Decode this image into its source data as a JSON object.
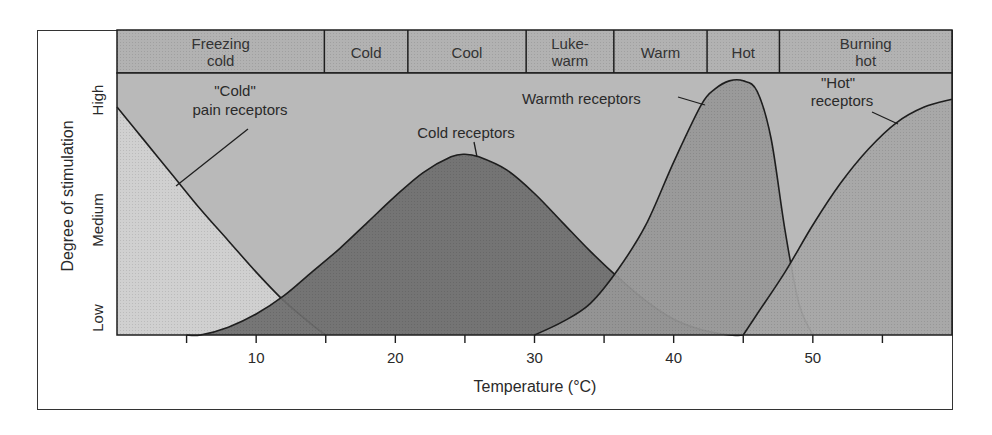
{
  "chart_data": {
    "type": "area",
    "title": "",
    "xlabel": "Temperature (°C)",
    "ylabel": "Degree of stimulation",
    "xlim": [
      0,
      60
    ],
    "xticks": [
      5,
      10,
      15,
      20,
      25,
      30,
      35,
      40,
      45,
      50,
      55
    ],
    "xtick_labels": {
      "10": "10",
      "20": "20",
      "30": "30",
      "40": "40",
      "50": "50"
    },
    "y_levels": [
      "Low",
      "Medium",
      "High"
    ],
    "ylim": [
      0,
      1
    ],
    "grid": false,
    "temperature_bands": [
      {
        "label_line1": "Freezing",
        "label_line2": "cold",
        "from": 0,
        "to": 14.9
      },
      {
        "label_line1": "Cold",
        "label_line2": "",
        "from": 14.9,
        "to": 20.9
      },
      {
        "label_line1": "Cool",
        "label_line2": "",
        "from": 20.9,
        "to": 29.4
      },
      {
        "label_line1": "Luke-",
        "label_line2": "warm",
        "from": 29.4,
        "to": 35.7
      },
      {
        "label_line1": "Warm",
        "label_line2": "",
        "from": 35.7,
        "to": 42.4
      },
      {
        "label_line1": "Hot",
        "label_line2": "",
        "from": 42.4,
        "to": 47.6
      },
      {
        "label_line1": "Burning",
        "label_line2": "hot",
        "from": 47.6,
        "to": 60
      }
    ],
    "series": [
      {
        "name": "\"Cold\" pain receptors",
        "x": [
          0,
          2,
          4,
          6,
          8,
          10,
          12,
          14,
          15
        ],
        "values": [
          0.87,
          0.74,
          0.61,
          0.48,
          0.36,
          0.24,
          0.13,
          0.04,
          0.0
        ]
      },
      {
        "name": "Cold receptors",
        "x": [
          5,
          6,
          8,
          10,
          12,
          14,
          16,
          18,
          20,
          22,
          24,
          25,
          26,
          28,
          30,
          32,
          34,
          36,
          38,
          40,
          42,
          44,
          45
        ],
        "values": [
          0.0,
          0.0,
          0.03,
          0.08,
          0.15,
          0.24,
          0.33,
          0.43,
          0.53,
          0.62,
          0.68,
          0.69,
          0.68,
          0.63,
          0.54,
          0.43,
          0.32,
          0.22,
          0.13,
          0.06,
          0.02,
          0.0,
          0.0
        ]
      },
      {
        "name": "Warmth receptors",
        "x": [
          30,
          32,
          34,
          36,
          38,
          40,
          42,
          43,
          44,
          45,
          46,
          47,
          48,
          49,
          50
        ],
        "values": [
          0.0,
          0.05,
          0.12,
          0.25,
          0.42,
          0.66,
          0.88,
          0.94,
          0.97,
          0.97,
          0.93,
          0.75,
          0.4,
          0.12,
          0.0
        ]
      },
      {
        "name": "\"Hot\" receptors",
        "x": [
          45,
          46,
          48,
          50,
          52,
          54,
          56,
          58,
          60
        ],
        "values": [
          0.0,
          0.08,
          0.24,
          0.42,
          0.58,
          0.71,
          0.81,
          0.87,
          0.9
        ]
      }
    ],
    "annotations": [
      {
        "text_line1": "\"Cold\"",
        "text_line2": "pain receptors",
        "points_to": "\"Cold\" pain receptors"
      },
      {
        "text_line1": "Cold receptors",
        "text_line2": "",
        "points_to": "Cold receptors"
      },
      {
        "text_line1": "Warmth receptors",
        "text_line2": "",
        "points_to": "Warmth receptors"
      },
      {
        "text_line1": "\"Hot\"",
        "text_line2": "receptors",
        "points_to": "\"Hot\" receptors"
      }
    ],
    "legend": "none (inline annotations)"
  },
  "colors": {
    "background_plot": "#b9b9b9",
    "header_band": "#b2b2b2",
    "cold_pain_fill": "#d0d0d0",
    "cold_fill": "#6e6e6e",
    "warmth_fill": "#979797",
    "hot_fill": "#a6a6a6",
    "line": "#1e1e1e"
  }
}
